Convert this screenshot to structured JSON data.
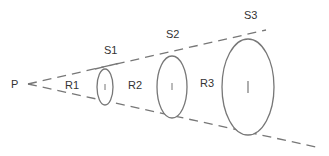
{
  "diagram": {
    "type": "inverse-square-law-cone",
    "source_label": "P",
    "surfaces": [
      {
        "label": "S1",
        "cx": 105,
        "cy": 87,
        "rx": 8,
        "ry": 18
      },
      {
        "label": "S2",
        "cx": 172,
        "cy": 87,
        "rx": 15,
        "ry": 31
      },
      {
        "label": "S3",
        "cx": 248,
        "cy": 87,
        "rx": 26,
        "ry": 48
      }
    ],
    "distances": [
      {
        "label": "R1"
      },
      {
        "label": "R2"
      },
      {
        "label": "R3"
      }
    ],
    "colors": {
      "stroke": "#777777",
      "text": "#333333",
      "background": "#ffffff"
    }
  }
}
